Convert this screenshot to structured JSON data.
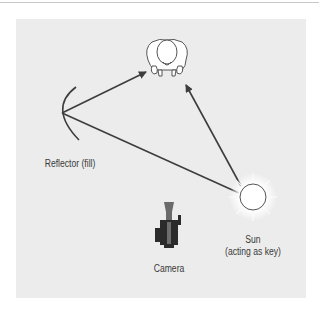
{
  "diagram": {
    "type": "lighting-setup-top-view",
    "nodes": [
      {
        "id": "subject",
        "label": ""
      },
      {
        "id": "reflector",
        "label": "Reflector (fill)"
      },
      {
        "id": "sun",
        "label_line1": "Sun",
        "label_line2": "(acting as key)"
      },
      {
        "id": "camera",
        "label": "Camera"
      }
    ],
    "edges": [
      {
        "from": "reflector",
        "to": "subject",
        "arrow": true
      },
      {
        "from": "sun",
        "to": "subject",
        "arrow": true
      },
      {
        "from": "sun",
        "to": "reflector",
        "arrow": false
      }
    ],
    "colors": {
      "panel": "#ececec",
      "line": "#3d3d3d",
      "camera_body": "#2b2b2b",
      "camera_lens": "#6e6e6e",
      "sun_fill": "#ffffff"
    }
  },
  "labels": {
    "reflector": "Reflector (fill)",
    "sun_line1": "Sun",
    "sun_line2": "(acting as key)",
    "camera": "Camera"
  }
}
